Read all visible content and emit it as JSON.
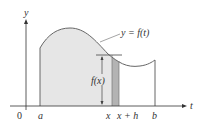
{
  "diagram": {
    "curve_label": "y = f(t)",
    "axis_labels": {
      "y": "y",
      "t": "t",
      "origin": "0"
    },
    "tick_labels": {
      "a": "a",
      "x": "x",
      "x_plus_h": "x + h",
      "b": "b"
    },
    "height_label": "f(x)",
    "colors": {
      "region_fill": "#e6e6e6",
      "strip_fill": "#b3b3b3",
      "curve": "#666666",
      "axes": "#333333"
    }
  }
}
